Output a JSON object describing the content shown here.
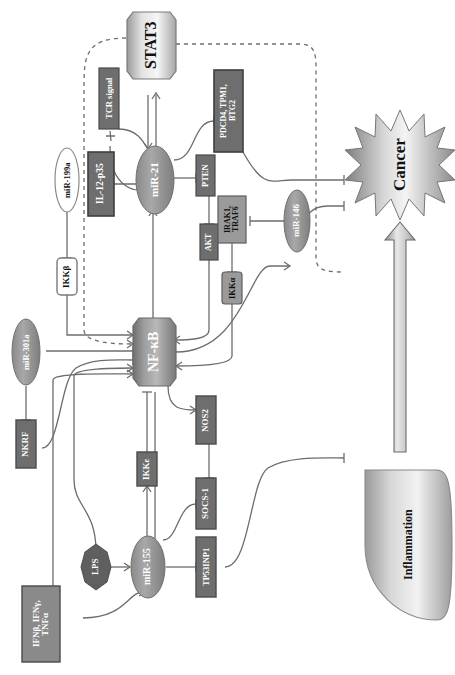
{
  "diagram": {
    "orientation": "rotated-90",
    "colors": {
      "dark_box": "#6e6e6e",
      "mid_box": "#8c8c8c",
      "light_box": "#ffffff",
      "ellipse_gray": "#8a8a8a",
      "ellipse_white": "#ffffff",
      "line": "#6d6d6d",
      "text_dark": "#111111",
      "text_light": "#ffffff"
    },
    "nodes": [
      {
        "id": "stat3",
        "label": "STAT3",
        "shape": "octagon",
        "fill": "light"
      },
      {
        "id": "tcr",
        "label": "TCR signal",
        "shape": "rect",
        "fill": "dark"
      },
      {
        "id": "pdcd4",
        "label": "PDCD4, TPM1,\nBTG2",
        "shape": "rect",
        "fill": "dark"
      },
      {
        "id": "mir199a",
        "label": "miR-199a",
        "shape": "ellipse",
        "fill": "white"
      },
      {
        "id": "il12p35",
        "label": "IL-12-p35",
        "shape": "rect",
        "fill": "dark"
      },
      {
        "id": "mir21",
        "label": "miR-21",
        "shape": "ellipse",
        "fill": "gray"
      },
      {
        "id": "pten",
        "label": "PTEN",
        "shape": "rect",
        "fill": "dark"
      },
      {
        "id": "akt",
        "label": "AKT",
        "shape": "rect",
        "fill": "dark"
      },
      {
        "id": "irak1",
        "label": "IRAK1,\nTRAF6",
        "shape": "rect",
        "fill": "mid"
      },
      {
        "id": "mir146",
        "label": "miR-146",
        "shape": "ellipse",
        "fill": "gray"
      },
      {
        "id": "ikka",
        "label": "IKKα",
        "shape": "rect",
        "fill": "mid"
      },
      {
        "id": "ikkb",
        "label": "IKKβ",
        "shape": "rect",
        "fill": "light"
      },
      {
        "id": "nfkb",
        "label": "NF-κB",
        "shape": "octagon",
        "fill": "gray"
      },
      {
        "id": "mir301a",
        "label": "miR-301a",
        "shape": "ellipse",
        "fill": "gray"
      },
      {
        "id": "nkrf",
        "label": "NKRF",
        "shape": "rect",
        "fill": "dark"
      },
      {
        "id": "nos2",
        "label": "NOS2",
        "shape": "rect",
        "fill": "dark"
      },
      {
        "id": "socs1",
        "label": "SOCS-1",
        "shape": "rect",
        "fill": "dark"
      },
      {
        "id": "ikke",
        "label": "IKKε",
        "shape": "rect",
        "fill": "dark"
      },
      {
        "id": "mir155",
        "label": "miR-155",
        "shape": "ellipse",
        "fill": "gray"
      },
      {
        "id": "lps",
        "label": "LPS",
        "shape": "heptagon",
        "fill": "dark"
      },
      {
        "id": "tp53inp1",
        "label": "TP53INP1",
        "shape": "rect",
        "fill": "dark"
      },
      {
        "id": "ifn",
        "label": "IFNβ, IFNγ,\nTNFα",
        "shape": "rect",
        "fill": "mid"
      },
      {
        "id": "cancer",
        "label": "Cancer",
        "shape": "starburst",
        "fill": "gradient"
      },
      {
        "id": "inflammation",
        "label": "Inflammation",
        "shape": "oval",
        "fill": "gradient"
      }
    ],
    "edges": [
      {
        "from": "stat3",
        "to": "mir21",
        "type": "activate"
      },
      {
        "from": "mir21",
        "to": "stat3",
        "type": "activate"
      },
      {
        "from": "tcr",
        "to": "mir21",
        "type": "activate"
      },
      {
        "from": "mir21",
        "to": "tcr",
        "type": "inhibit"
      },
      {
        "from": "mir21",
        "to": "il12p35",
        "type": "inhibit"
      },
      {
        "from": "mir199a",
        "to": "ikkb",
        "type": "inhibit"
      },
      {
        "from": "mir21",
        "to": "pdcd4",
        "type": "inhibit"
      },
      {
        "from": "mir21",
        "to": "pten",
        "type": "inhibit"
      },
      {
        "from": "pten",
        "to": "akt",
        "type": "inhibit"
      },
      {
        "from": "akt",
        "to": "nfkb",
        "type": "activate"
      },
      {
        "from": "nfkb",
        "to": "mir21",
        "type": "activate"
      },
      {
        "from": "mir146",
        "to": "irak1",
        "type": "inhibit"
      },
      {
        "from": "irak1",
        "to": "ikka",
        "type": "inhibit"
      },
      {
        "from": "ikka",
        "to": "nfkb",
        "type": "activate"
      },
      {
        "from": "nfkb",
        "to": "mir146",
        "type": "activate"
      },
      {
        "from": "ikkb",
        "to": "nfkb",
        "type": "activate"
      },
      {
        "from": "mir301a",
        "to": "nkrf",
        "type": "inhibit"
      },
      {
        "from": "nkrf",
        "to": "nfkb",
        "type": "inhibit"
      },
      {
        "from": "mir301a",
        "to": "nfkb",
        "type": "inhibit"
      },
      {
        "from": "nfkb",
        "to": "nos2",
        "type": "activate"
      },
      {
        "from": "nos2",
        "to": "socs1",
        "type": "inhibit"
      },
      {
        "from": "socs1",
        "to": "mir155",
        "type": "inhibit"
      },
      {
        "from": "mir155",
        "to": "tp53inp1",
        "type": "inhibit"
      },
      {
        "from": "mir155",
        "to": "ikke",
        "type": "activate"
      },
      {
        "from": "ikke",
        "to": "nfkb",
        "type": "inhibit"
      },
      {
        "from": "lps",
        "to": "mir155",
        "type": "activate"
      },
      {
        "from": "lps",
        "to": "nfkb",
        "type": "activate"
      },
      {
        "from": "ifn",
        "to": "mir155",
        "type": "activate"
      },
      {
        "from": "ifn",
        "to": "nfkb",
        "type": "activate"
      },
      {
        "from": "pdcd4",
        "to": "cancer",
        "type": "inhibit"
      },
      {
        "from": "mir146",
        "to": "cancer",
        "type": "inhibit"
      },
      {
        "from": "tp53inp1",
        "to": "cancer",
        "type": "inhibit"
      },
      {
        "from": "inflammation",
        "to": "cancer",
        "type": "big-arrow"
      }
    ]
  }
}
